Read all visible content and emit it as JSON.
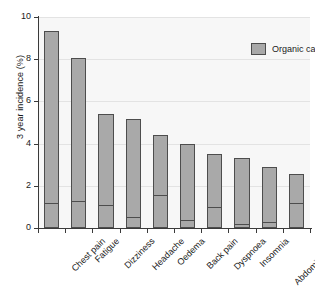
{
  "chart_data": {
    "type": "bar",
    "title": "",
    "subtitle": "",
    "xlabel": "",
    "ylabel": "3 year incidence (%)",
    "ylim": [
      0,
      10
    ],
    "yticks": [
      0,
      2,
      4,
      6,
      8,
      10
    ],
    "ytick_labels": [
      "0",
      "2",
      "4",
      "6",
      "8",
      "10"
    ],
    "grid": true,
    "grid_axis": "y",
    "legend": {
      "position": "top-right",
      "entries": [
        {
          "label": "Organic cause",
          "color": "#a9a9a9"
        }
      ]
    },
    "stacked": true,
    "categories": [
      "Chest pain",
      "Fatigue",
      "Dizziness",
      "Headache",
      "Oedema",
      "Back pain",
      "Dyspnoea",
      "Insomnia",
      "Abdominal pain",
      "Numbness"
    ],
    "series": [
      {
        "name": "Total 3 year incidence",
        "values": [
          9.35,
          8.05,
          5.4,
          5.15,
          4.4,
          4.0,
          3.5,
          3.3,
          2.9,
          2.55
        ]
      },
      {
        "name": "Organic cause",
        "values": [
          1.2,
          1.3,
          1.1,
          0.5,
          1.55,
          0.4,
          1.0,
          0.2,
          0.3,
          1.2
        ]
      }
    ],
    "colors": {
      "bar_fill": "#a9a9a9",
      "bar_edge": "#4d4d4d",
      "plot_background": "#f7f7f7",
      "gridline": "#e3e3e3",
      "axis": "#3a3a3a",
      "text": "#1a1a1a"
    }
  }
}
